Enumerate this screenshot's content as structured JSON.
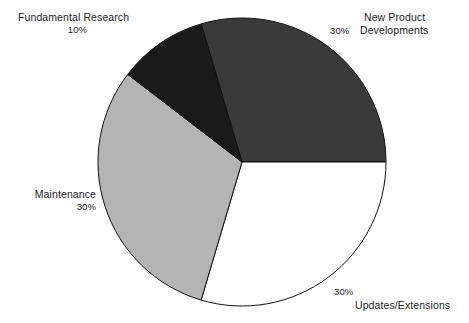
{
  "chart_data": {
    "type": "pie",
    "title": "",
    "subtitle": "",
    "xlabel": "",
    "ylabel": "",
    "legend_position": "none",
    "grid": false,
    "units": "percent",
    "total": 100,
    "center": {
      "x": 242,
      "y": 162
    },
    "radius": 144,
    "start_angle_deg": -16.5,
    "direction": "clockwise",
    "slices": [
      {
        "label": "New Product Developments",
        "label_lines": [
          "New Product",
          "Developments"
        ],
        "value": 30,
        "value_text": "30%",
        "color": "#3a3a3a",
        "stroke": "#111111",
        "start_angle_deg": -16.5,
        "end_angle_deg": 90.0
      },
      {
        "label": "Updates/Extensions",
        "label_lines": [
          "Updates/Extensions"
        ],
        "value": 30,
        "value_text": "30%",
        "color": "#ffffff",
        "stroke": "#111111",
        "start_angle_deg": 90.0,
        "end_angle_deg": 196.5
      },
      {
        "label": "Maintenance",
        "label_lines": [
          "Maintenance"
        ],
        "value": 30,
        "value_text": "30%",
        "color": "#b4b4b4",
        "stroke": "#111111",
        "start_angle_deg": 196.5,
        "end_angle_deg": 307.5
      },
      {
        "label": "Fundamental Research",
        "label_lines": [
          "Fundamental Research"
        ],
        "value": 10,
        "value_text": "10%",
        "color": "#1a1a1a",
        "stroke": "#111111",
        "start_angle_deg": 307.5,
        "end_angle_deg": 343.5
      }
    ],
    "categories": [
      "New Product Developments",
      "Updates/Extensions",
      "Maintenance",
      "Fundamental Research"
    ],
    "values": [
      30,
      30,
      30,
      10
    ]
  },
  "labels": {
    "fundamental_research": {
      "name": "Fundamental Research",
      "percent": "10%"
    },
    "new_product": {
      "line1": "New Product",
      "line2": "Developments",
      "percent": "30%"
    },
    "maintenance": {
      "name": "Maintenance",
      "percent": "30%"
    },
    "updates_extensions": {
      "name": "Updates/Extensions",
      "percent": "30%"
    }
  },
  "colors": {
    "background": "#ffffff",
    "text": "#1c1c1c",
    "slice_new_product": "#3a3a3a",
    "slice_updates": "#ffffff",
    "slice_maintenance": "#b4b4b4",
    "slice_fundamental": "#1a1a1a",
    "outline": "#111111"
  }
}
